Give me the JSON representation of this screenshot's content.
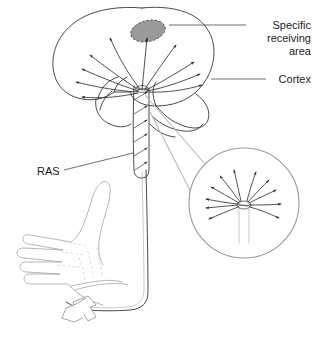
{
  "figure": {
    "background_color": "#ffffff"
  },
  "labels": [
    {
      "id": "specific-receiving-area",
      "lines": [
        "Specific",
        "receiving",
        "area"
      ],
      "text": "Specific receiving area",
      "align": "right",
      "anchor_x": 311,
      "line_y": [
        25,
        38,
        51
      ],
      "leader": {
        "x1": 169,
        "y1": 25,
        "x2": 246,
        "y2": 25
      }
    },
    {
      "id": "cortex",
      "lines": [
        "Cortex"
      ],
      "text": "Cortex",
      "align": "right",
      "anchor_x": 311,
      "line_y": [
        82
      ],
      "leader": {
        "x1": 211,
        "y1": 79,
        "x2": 266,
        "y2": 79
      }
    },
    {
      "id": "ras",
      "lines": [
        "RAS"
      ],
      "text": "RAS",
      "align": "left",
      "anchor_x": 37,
      "line_y": [
        172
      ],
      "leader": {
        "x1": 64,
        "y1": 170,
        "x2": 133,
        "y2": 153
      }
    }
  ],
  "anatomy": {
    "cortex_label": "Cortex",
    "specific_area_label": "Specific receiving area",
    "ras_label": "RAS",
    "specific_area_fill": "#9a9a9a",
    "specific_area_stroke": "#4c4c4c",
    "outline_stroke": "#2b2b2b",
    "arrow_stroke": "#262626",
    "inset_ring_stroke": "#9a9a9a",
    "hand_stroke": "#9d9d9d",
    "cone_stroke": "#b8b8b8",
    "hub": {
      "x": 142,
      "y": 90
    },
    "inset": {
      "cx": 244,
      "cy": 203,
      "r": 55
    },
    "parts": [
      "cerebral-cortex-outline",
      "specific-receiving-area",
      "cortical-radiating-arrows",
      "temporal-lobe",
      "cerebellum",
      "brainstem-reticular-formation",
      "ascending-nerve-fiber",
      "hand",
      "stimulus-arrow",
      "magnifier-inset"
    ]
  }
}
